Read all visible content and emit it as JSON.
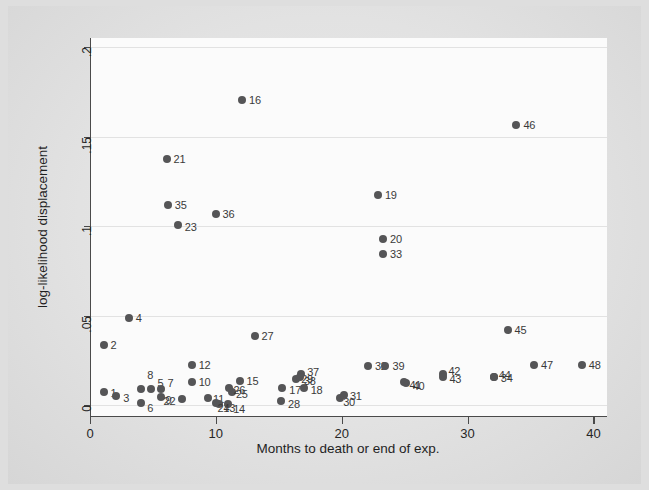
{
  "figure": {
    "background_color": "#dedede",
    "plot_background_color": "#fbfbfb",
    "marker_color": "#555557",
    "axis_color": "#4a4a4a",
    "grid_color": "#e2e2e2"
  },
  "chart_data": {
    "type": "scatter",
    "title": "",
    "xlabel": "Months to death or end of exp.",
    "ylabel": "log-likelihood displacement",
    "xlim": [
      0,
      41
    ],
    "ylim": [
      -0.006,
      0.205
    ],
    "xticks": [
      "0",
      "10",
      "20",
      "30",
      "40"
    ],
    "xtick_values": [
      0,
      10,
      20,
      30,
      40
    ],
    "yticks": [
      "0",
      ".05",
      ".1",
      ".15",
      ".2"
    ],
    "ytick_values": [
      0,
      0.05,
      0.1,
      0.15,
      0.2
    ],
    "grid": "horizontal",
    "legend": "none",
    "labels_position": "right-of-marker",
    "points": [
      {
        "label": "1",
        "x": 1.0,
        "y": 0.0075,
        "lx": 7,
        "ly": 1
      },
      {
        "label": "2",
        "x": 1.0,
        "y": 0.0335,
        "lx": 7,
        "ly": 0
      },
      {
        "label": "3",
        "x": 2.0,
        "y": 0.005,
        "lx": 7,
        "ly": 2
      },
      {
        "label": "4",
        "x": 3.0,
        "y": 0.0485,
        "lx": 7,
        "ly": 0
      },
      {
        "label": "5",
        "x": 4.8,
        "y": 0.009,
        "lx": 6,
        "ly": -6
      },
      {
        "label": "6",
        "x": 4.0,
        "y": 0.001,
        "lx": 6,
        "ly": 5
      },
      {
        "label": "7",
        "x": 5.6,
        "y": 0.009,
        "lx": 6,
        "ly": -6
      },
      {
        "label": "8",
        "x": 4.0,
        "y": 0.009,
        "lx": 6,
        "ly": -14
      },
      {
        "label": "9",
        "x": 5.6,
        "y": 0.0045,
        "lx": 4,
        "ly": 3
      },
      {
        "label": "10",
        "x": 8.0,
        "y": 0.013,
        "lx": 7,
        "ly": 0
      },
      {
        "label": "11",
        "x": 9.3,
        "y": 0.004,
        "lx": 5,
        "ly": 1
      },
      {
        "label": "12",
        "x": 8.0,
        "y": 0.0222,
        "lx": 7,
        "ly": 0
      },
      {
        "label": "13",
        "x": 10.2,
        "y": 0.0008,
        "lx": 4,
        "ly": 4
      },
      {
        "label": "14",
        "x": 10.9,
        "y": 0.0008,
        "lx": 5,
        "ly": 5
      },
      {
        "label": "15",
        "x": 11.8,
        "y": 0.0135,
        "lx": 7,
        "ly": 0
      },
      {
        "label": "16",
        "x": 12.0,
        "y": 0.1705,
        "lx": 7,
        "ly": 0
      },
      {
        "label": "17",
        "x": 15.2,
        "y": 0.0095,
        "lx": 7,
        "ly": 2
      },
      {
        "label": "18",
        "x": 16.9,
        "y": 0.0095,
        "lx": 7,
        "ly": 2
      },
      {
        "label": "19",
        "x": 22.8,
        "y": 0.1175,
        "lx": 7,
        "ly": 0
      },
      {
        "label": "20",
        "x": 23.2,
        "y": 0.093,
        "lx": 7,
        "ly": 0
      },
      {
        "label": "21",
        "x": 6.0,
        "y": 0.1375,
        "lx": 7,
        "ly": 0
      },
      {
        "label": "22",
        "x": 7.2,
        "y": 0.0035,
        "lx": -18,
        "ly": 2
      },
      {
        "label": "23",
        "x": 6.9,
        "y": 0.1005,
        "lx": 7,
        "ly": 2
      },
      {
        "label": "24",
        "x": 9.9,
        "y": 0.0012,
        "lx": 2,
        "ly": 5
      },
      {
        "label": "25",
        "x": 11.2,
        "y": 0.0075,
        "lx": 4,
        "ly": 2
      },
      {
        "label": "26",
        "x": 11.0,
        "y": 0.0098,
        "lx": 4,
        "ly": 2
      },
      {
        "label": "27",
        "x": 13.0,
        "y": 0.0385,
        "lx": 7,
        "ly": 0
      },
      {
        "label": "28",
        "x": 15.1,
        "y": 0.0025,
        "lx": 7,
        "ly": 3
      },
      {
        "label": "29",
        "x": 16.3,
        "y": 0.0145,
        "lx": 5,
        "ly": 0
      },
      {
        "label": "30",
        "x": 19.8,
        "y": 0.004,
        "lx": 3,
        "ly": 4
      },
      {
        "label": "31",
        "x": 20.1,
        "y": 0.0055,
        "lx": 6,
        "ly": 1
      },
      {
        "label": "32",
        "x": 22.0,
        "y": 0.0218,
        "lx": 7,
        "ly": 0
      },
      {
        "label": "33",
        "x": 23.2,
        "y": 0.0845,
        "lx": 7,
        "ly": 0
      },
      {
        "label": "34",
        "x": 32.0,
        "y": 0.0155,
        "lx": 7,
        "ly": 1
      },
      {
        "label": "35",
        "x": 6.1,
        "y": 0.1118,
        "lx": 7,
        "ly": 0
      },
      {
        "label": "36",
        "x": 9.9,
        "y": 0.1065,
        "lx": 7,
        "ly": 0
      },
      {
        "label": "37",
        "x": 16.7,
        "y": 0.0172,
        "lx": 6,
        "ly": -2
      },
      {
        "label": "38",
        "x": 16.6,
        "y": 0.016,
        "lx": 4,
        "ly": 4
      },
      {
        "label": "39",
        "x": 23.4,
        "y": 0.0218,
        "lx": 7,
        "ly": 0
      },
      {
        "label": "40",
        "x": 25.0,
        "y": 0.0125,
        "lx": 7,
        "ly": 3
      },
      {
        "label": "41",
        "x": 24.9,
        "y": 0.0128,
        "lx": 5,
        "ly": 3
      },
      {
        "label": "42",
        "x": 28.0,
        "y": 0.0172,
        "lx": 5,
        "ly": -3
      },
      {
        "label": "43",
        "x": 28.0,
        "y": 0.0158,
        "lx": 6,
        "ly": 2
      },
      {
        "label": "44",
        "x": 32.0,
        "y": 0.0158,
        "lx": 5,
        "ly": -2
      },
      {
        "label": "45",
        "x": 33.1,
        "y": 0.042,
        "lx": 7,
        "ly": 0
      },
      {
        "label": "46",
        "x": 33.8,
        "y": 0.1562,
        "lx": 7,
        "ly": 0
      },
      {
        "label": "47",
        "x": 35.2,
        "y": 0.0225,
        "lx": 7,
        "ly": 0
      },
      {
        "label": "48",
        "x": 39.0,
        "y": 0.0225,
        "lx": 7,
        "ly": 0
      }
    ]
  }
}
